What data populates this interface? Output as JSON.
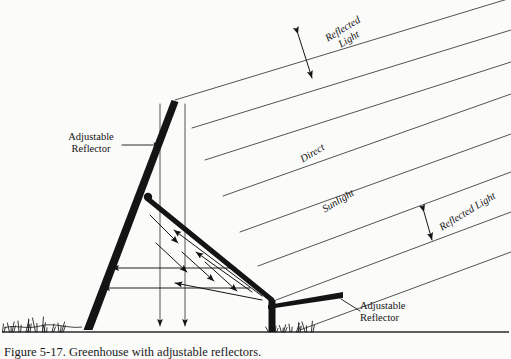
{
  "figure": {
    "caption": "Figure 5-17.  Greenhouse with adjustable reflectors.",
    "caption_clipped": true
  },
  "labels": {
    "adjustable_reflector_top": "Adjustable\nReflector",
    "adjustable_reflector_bottom": "Adjustable\nReflector",
    "reflected_light_top": "Reflected\nLight",
    "reflected_light_right": "Reflected  Light",
    "direct": "Direct",
    "sunlight": "Sunlight"
  },
  "colors": {
    "ink": "#141414",
    "ray": "#4a4a4a",
    "paper": "#fbfbfa",
    "ground": "#2a2a2a"
  },
  "geometry": {
    "ground_y": 332,
    "ground_x1": 2,
    "ground_x2": 509,
    "ray_angle_deg": 31,
    "tall_reflector": {
      "apex": [
        175,
        100
      ],
      "base": [
        88,
        330
      ],
      "pivot": [
        148,
        197
      ],
      "width_top": 7,
      "width_bottom": 9
    },
    "strut": {
      "from": [
        148,
        199
      ],
      "to": [
        272,
        300
      ],
      "width": 5
    },
    "post": {
      "x": 272,
      "top": 300,
      "bottom": 332,
      "width": 7
    },
    "low_reflector": {
      "from": [
        268,
        302
      ],
      "to": [
        343,
        293
      ],
      "width": 6
    },
    "vertical_drop_arrows": [
      {
        "x": 160,
        "y1": 104,
        "y2": 326
      },
      {
        "x": 185,
        "y1": 104,
        "y2": 326
      }
    ],
    "sun_rays": [
      {
        "x1": 175,
        "y1": 100,
        "x2": 511,
        "y2": -2
      },
      {
        "x1": 192,
        "y1": 128,
        "x2": 511,
        "y2": 30
      },
      {
        "x1": 205,
        "y1": 160,
        "x2": 511,
        "y2": 62
      },
      {
        "x1": 223,
        "y1": 196,
        "x2": 511,
        "y2": 94
      },
      {
        "x1": 240,
        "y1": 232,
        "x2": 511,
        "y2": 134
      },
      {
        "x1": 258,
        "y1": 266,
        "x2": 511,
        "y2": 172
      },
      {
        "x1": 276,
        "y1": 300,
        "x2": 511,
        "y2": 212
      },
      {
        "x1": 300,
        "y1": 330,
        "x2": 511,
        "y2": 252
      }
    ],
    "reflected_arrows_down_right": [
      {
        "x1": 150,
        "y1": 215,
        "x2": 178,
        "y2": 243
      },
      {
        "x1": 156,
        "y1": 243,
        "x2": 187,
        "y2": 272
      },
      {
        "x1": 182,
        "y1": 252,
        "x2": 214,
        "y2": 281
      },
      {
        "x1": 205,
        "y1": 262,
        "x2": 237,
        "y2": 291
      }
    ],
    "reflected_arrows_up_left": [
      {
        "x1": 262,
        "y1": 300,
        "x2": 175,
        "y2": 283
      },
      {
        "x1": 262,
        "y1": 296,
        "x2": 174,
        "y2": 230
      },
      {
        "x1": 252,
        "y1": 292,
        "x2": 196,
        "y2": 252
      }
    ],
    "horizontal_arrows_left": [
      {
        "x1": 236,
        "y1": 268,
        "x2": 112,
        "y2": 268
      },
      {
        "x1": 250,
        "y1": 288,
        "x2": 103,
        "y2": 288
      }
    ],
    "dimension_top": {
      "x1": 298,
      "y1": 34,
      "x2": 312,
      "y2": 78
    },
    "dimension_right": {
      "x1": 424,
      "y1": 212,
      "x2": 432,
      "y2": 240
    },
    "leader_top": {
      "x1": 122,
      "y1": 145,
      "x2": 160,
      "y2": 145
    },
    "leader_bottom": {
      "x1": 341,
      "y1": 299,
      "x2": 360,
      "y2": 311
    },
    "grass_left_x": 30,
    "grass_right_x": 272
  }
}
